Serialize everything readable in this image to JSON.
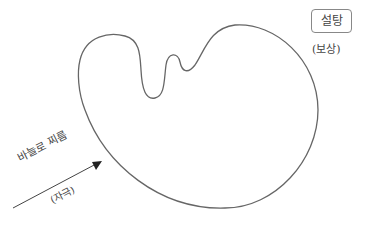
{
  "diagram": {
    "organism_outline_color": "#666666",
    "reward": {
      "label": "설탕",
      "sublabel": "(보상)"
    },
    "stimulus": {
      "label": "바늘로 찌름",
      "sublabel": "(자극)"
    }
  }
}
